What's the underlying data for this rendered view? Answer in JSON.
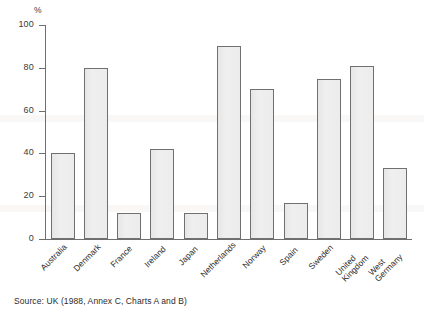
{
  "chart_data": {
    "type": "bar",
    "title": "",
    "subtitle": "",
    "xlabel": "",
    "ylabel": "%",
    "ylim": [
      0,
      100
    ],
    "yticks": [
      0,
      20,
      40,
      60,
      80,
      100
    ],
    "grid": false,
    "legend": "none",
    "categories": [
      "Australia",
      "Denmark",
      "France",
      "Ireland",
      "Japan",
      "Netherlands",
      "Norway",
      "Spain",
      "Sweden",
      "United Kingdom",
      "West Germany"
    ],
    "category_lines": [
      [
        "Australia"
      ],
      [
        "Denmark"
      ],
      [
        "France"
      ],
      [
        "Ireland"
      ],
      [
        "Japan"
      ],
      [
        "Netherlands"
      ],
      [
        "Norway"
      ],
      [
        "Spain"
      ],
      [
        "Sweden"
      ],
      [
        "United",
        "Kingdom"
      ],
      [
        "West",
        "Germany"
      ]
    ],
    "values": [
      40,
      80,
      12,
      42,
      12,
      90,
      70,
      17,
      75,
      81,
      33
    ],
    "annotations": [],
    "colors": {
      "bar_fill": "#ebebeb",
      "bar_stroke": "#707070",
      "axis": "#6f6f6f",
      "text": "#2b2b2b",
      "background": "#ffffff"
    }
  },
  "axis": {
    "unit_label": "%",
    "tick_labels": [
      "100",
      "80",
      "60",
      "40",
      "20",
      "0"
    ]
  },
  "footer": {
    "source": "Source: UK (1988, Annex C, Charts A and B)"
  }
}
